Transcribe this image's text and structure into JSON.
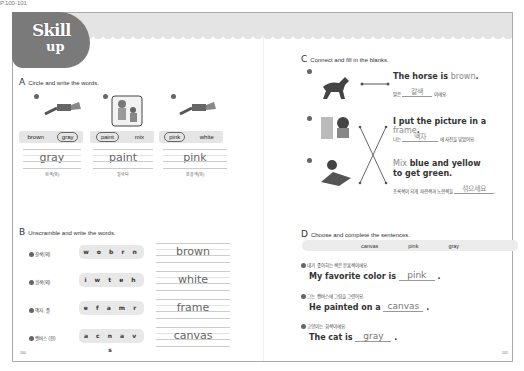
{
  "header": {
    "badge_line1": "Skill",
    "badge_line2": "up",
    "top_mark": "P.100-101"
  },
  "sectionA": {
    "letter": "A",
    "instruction": "Circle and write the words.",
    "items": [
      {
        "num": "1",
        "image": "gray-paint-tube",
        "choices": [
          "brown",
          "gray"
        ],
        "circled": "gray",
        "answer": "gray",
        "hint": "회색(의)"
      },
      {
        "num": "2",
        "image": "painting-people",
        "choices": [
          "paint",
          "mix"
        ],
        "circled": "paint",
        "answer": "paint",
        "hint": "칠하다"
      },
      {
        "num": "3",
        "image": "pink-paint-tube",
        "choices": [
          "pink",
          "white"
        ],
        "circled": "pink",
        "answer": "pink",
        "hint": "분홍색(의)"
      }
    ]
  },
  "sectionB": {
    "letter": "B",
    "instruction": "Unscramble and write the words.",
    "items": [
      {
        "num": "1",
        "hint": "갈색(의)",
        "scrambled": "w o b r n",
        "answer": "brown"
      },
      {
        "num": "2",
        "hint": "흰색(의)",
        "scrambled": "i w t e h",
        "answer": "white"
      },
      {
        "num": "3",
        "hint": "액자, 틀",
        "scrambled": "e f a m r",
        "answer": "frame"
      },
      {
        "num": "4",
        "hint": "캔버스 (천)",
        "scrambled": "a c n a v s",
        "answer": "canvas"
      }
    ]
  },
  "sectionC": {
    "letter": "C",
    "instruction": "Connect and fill in the blanks.",
    "items": [
      {
        "num": "1",
        "image": "horse",
        "sentence_pre": "The horse is ",
        "sentence_hl": "brown",
        "sentence_post": ".",
        "kr_pre": "말은",
        "kr_blank": "갈색",
        "kr_post": "이에요."
      },
      {
        "num": "2",
        "image": "picture-frame",
        "sentence_pre": "I put the picture in a ",
        "sentence_hl": "frame",
        "sentence_post": ".",
        "kr_pre": "나는",
        "kr_blank": "액자",
        "kr_post": "에 사진을 넣었어요."
      },
      {
        "num": "3",
        "image": "painting-girl",
        "sentence_hl": "Mix",
        "sentence_post": " blue and yellow",
        "sentence_line2": "to get green.",
        "kr_pre": "초록색이 되게 파란색과 노란색을",
        "kr_blank": "섞으세요",
        "kr_post": "."
      }
    ]
  },
  "sectionD": {
    "letter": "D",
    "instruction": "Choose and complete the sentences.",
    "word_bank": [
      "canvas",
      "pink",
      "gray"
    ],
    "items": [
      {
        "num": "1",
        "kr": "내가 좋아하는 색은 분홍색이에요.",
        "pre": "My favorite color is",
        "answer": "pink",
        "post": "."
      },
      {
        "num": "2",
        "kr": "그는 캔버스에 그림을 그렸어요.",
        "pre": "He painted on a",
        "answer": "canvas",
        "post": "."
      },
      {
        "num": "3",
        "kr": "고양이는 회색이에요.",
        "pre": "The cat is",
        "answer": "gray",
        "post": "."
      }
    ]
  },
  "page_numbers": {
    "left": "100",
    "right": "101"
  }
}
